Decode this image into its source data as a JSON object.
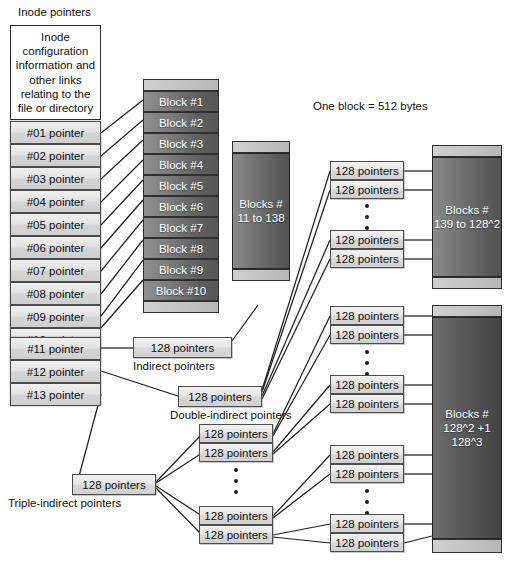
{
  "diagram": {
    "title_label": "Inode pointers",
    "note_label": "One block = 512 bytes",
    "inode_header": "Inode configuration information and other links relating to the file or directory",
    "inode_pointers": [
      "#01 pointer",
      "#02 pointer",
      "#03 pointer",
      "#04 pointer",
      "#05 pointer",
      "#06 pointer",
      "#07 pointer",
      "#08 pointer",
      "#09 pointer",
      "#10 pointer",
      "#11 pointer",
      "#12 pointer",
      "#13 pointer"
    ],
    "direct_blocks": [
      "Block #1",
      "Block #2",
      "Block #3",
      "Block #4",
      "Block #5",
      "Block #6",
      "Block #7",
      "Block #8",
      "Block #9",
      "Block #10"
    ],
    "block_groups": {
      "indirect_range": "Blocks # 11 to 138",
      "indirect_range_line1": "Blocks #",
      "indirect_range_line2": "11 to 138",
      "double_range_line1": "Blocks #",
      "double_range_line2": "139 to 128^2",
      "triple_range_line1": "Blocks #",
      "triple_range_line2": "128^2 +1",
      "triple_range_line3": "128^3"
    },
    "pointer_box_label": "128 pointers",
    "level_labels": {
      "indirect": "Indirect pointers",
      "double_indirect": "Double-indirect pointers",
      "triple_indirect": "Triple-indirect pointers"
    },
    "colors": {
      "block_dark": "#5e5e5e",
      "block_light": "#8f8f8f",
      "box_fill": "#e6e6e6",
      "outline": "#2b2b2b",
      "background": "#ffffff",
      "text": "#111111",
      "block_text": "#ffffff"
    }
  }
}
